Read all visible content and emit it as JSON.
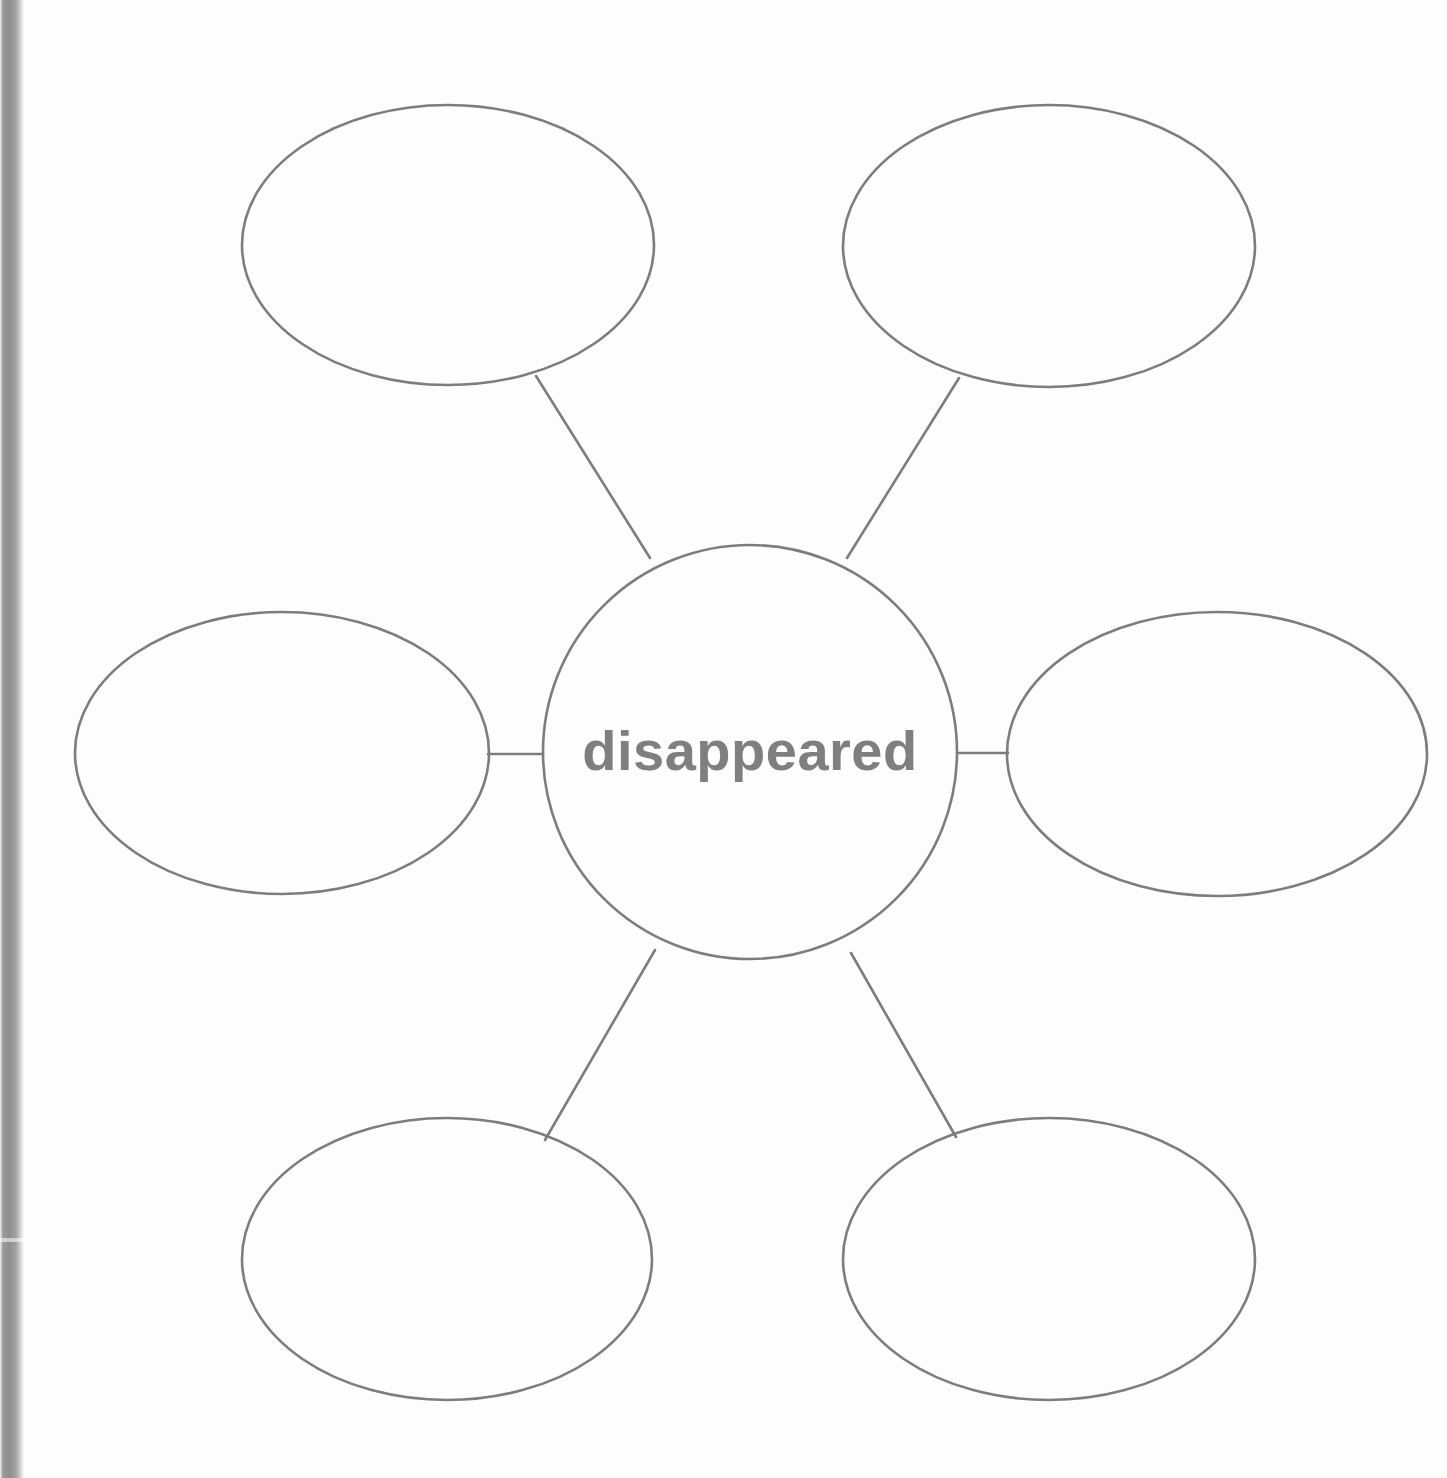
{
  "page": {
    "background_color": "#fdfdfd",
    "stroke_color": "#7d7d7d",
    "text_color": "#7f7f7f",
    "binding_shadow_color": "#8e8e8e",
    "width": 1447,
    "height": 1478
  },
  "diagram": {
    "type": "word-web",
    "center": {
      "label": "disappeared",
      "shape": "circle",
      "cx": 750,
      "cy": 752,
      "r": 207
    },
    "branches": [
      {
        "id": "top-left",
        "label": "",
        "shape": "ellipse",
        "cx": 448,
        "cy": 245,
        "rx": 206,
        "ry": 140
      },
      {
        "id": "top-right",
        "label": "",
        "shape": "ellipse",
        "cx": 1049,
        "cy": 246,
        "rx": 206,
        "ry": 141
      },
      {
        "id": "middle-left",
        "label": "",
        "shape": "ellipse",
        "cx": 282,
        "cy": 753,
        "rx": 207,
        "ry": 141
      },
      {
        "id": "middle-right",
        "label": "",
        "shape": "ellipse",
        "cx": 1217,
        "cy": 754,
        "rx": 210,
        "ry": 142
      },
      {
        "id": "bottom-left",
        "label": "",
        "shape": "ellipse",
        "cx": 447,
        "cy": 1259,
        "rx": 205,
        "ry": 141
      },
      {
        "id": "bottom-right",
        "label": "",
        "shape": "ellipse",
        "cx": 1049,
        "cy": 1259,
        "rx": 206,
        "ry": 141
      }
    ],
    "connectors": [
      {
        "id": "connector-top-left",
        "from": "center",
        "to": "top-left",
        "x1": 650,
        "y1": 558,
        "x2": 536,
        "y2": 376
      },
      {
        "id": "connector-top-right",
        "from": "center",
        "to": "top-right",
        "x1": 847,
        "y1": 558,
        "x2": 959,
        "y2": 378
      },
      {
        "id": "connector-middle-left",
        "from": "center",
        "to": "middle-left",
        "x1": 543,
        "y1": 754,
        "x2": 488,
        "y2": 754
      },
      {
        "id": "connector-middle-right",
        "from": "center",
        "to": "middle-right",
        "x1": 957,
        "y1": 753,
        "x2": 1008,
        "y2": 753
      },
      {
        "id": "connector-bottom-left",
        "from": "center",
        "to": "bottom-left",
        "x1": 655,
        "y1": 950,
        "x2": 545,
        "y2": 1140
      },
      {
        "id": "connector-bottom-right",
        "from": "center",
        "to": "bottom-right",
        "x1": 851,
        "y1": 953,
        "x2": 956,
        "y2": 1137
      }
    ]
  }
}
